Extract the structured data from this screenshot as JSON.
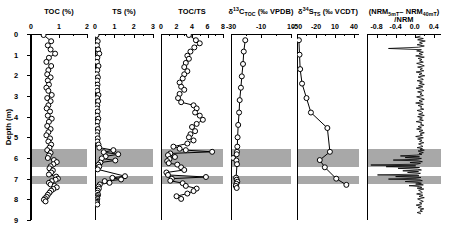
{
  "figure": {
    "y_axis": {
      "label": "Depth (m)",
      "ticks": [
        0,
        1,
        2,
        3,
        4,
        5,
        6,
        7,
        8,
        9
      ],
      "range": [
        0,
        9
      ]
    },
    "shaded_bands": [
      {
        "top": 5.58,
        "bottom": 6.42,
        "color": "#a8a8a8"
      },
      {
        "top": 6.86,
        "bottom": 7.28,
        "color": "#a8a8a8"
      }
    ]
  },
  "chart_data": [
    {
      "type": "line",
      "title": "TOC (%)",
      "xlabel": "TOC (%)",
      "ylabel": "Depth (m)",
      "xlim": [
        0,
        2
      ],
      "ylim": [
        0,
        9
      ],
      "xticks": [
        0,
        1,
        2
      ],
      "xticklabels": [
        "0",
        "1",
        "2"
      ],
      "yticks": [
        0,
        1,
        2,
        3,
        4,
        5,
        6,
        7,
        8,
        9
      ],
      "grid": false,
      "marker": "open-circle",
      "x": [
        0.45,
        0.72,
        0.6,
        0.7,
        0.86,
        0.64,
        0.55,
        0.72,
        0.62,
        0.58,
        0.7,
        0.6,
        0.64,
        0.55,
        0.62,
        0.74,
        0.58,
        0.7,
        0.62,
        0.56,
        0.68,
        0.6,
        0.74,
        0.64,
        0.58,
        0.7,
        0.62,
        0.55,
        0.68,
        0.62,
        0.72,
        0.66,
        0.58,
        0.7,
        0.64,
        0.6,
        0.82,
        0.92,
        0.8,
        0.7,
        0.66,
        0.78,
        0.72,
        0.64,
        0.9,
        0.96,
        0.88,
        0.74,
        0.64,
        0.7,
        0.84,
        0.92,
        0.8,
        0.72,
        0.66,
        0.6,
        0.56,
        0.5,
        0.46,
        0.52
      ],
      "y": [
        0.05,
        0.35,
        0.55,
        0.75,
        0.95,
        1.15,
        1.35,
        1.55,
        1.75,
        1.95,
        2.1,
        2.25,
        2.45,
        2.6,
        2.75,
        2.95,
        3.1,
        3.25,
        3.45,
        3.6,
        3.75,
        3.95,
        4.1,
        4.25,
        4.45,
        4.6,
        4.75,
        4.9,
        5.05,
        5.2,
        5.35,
        5.5,
        5.62,
        5.75,
        5.88,
        6.0,
        6.1,
        6.2,
        6.3,
        6.4,
        6.5,
        6.6,
        6.7,
        6.8,
        6.9,
        7.0,
        7.05,
        7.12,
        7.2,
        7.28,
        7.35,
        7.42,
        7.5,
        7.58,
        7.68,
        7.78,
        7.88,
        7.95,
        8.02,
        8.1
      ]
    },
    {
      "type": "line",
      "title": "TS (%)",
      "xlabel": "TS (%)",
      "ylabel": "Depth (m)",
      "xlim": [
        0,
        3
      ],
      "ylim": [
        0,
        9
      ],
      "xticks": [
        0,
        1,
        2,
        3
      ],
      "xticklabels": [
        "0",
        "1",
        "2",
        "3"
      ],
      "grid": false,
      "marker": "open-circle",
      "x": [
        0.08,
        0.14,
        0.1,
        0.16,
        0.22,
        0.12,
        0.1,
        0.18,
        0.12,
        0.09,
        0.15,
        0.11,
        0.13,
        0.1,
        0.12,
        0.18,
        0.11,
        0.16,
        0.12,
        0.1,
        0.14,
        0.11,
        0.17,
        0.13,
        0.1,
        0.15,
        0.12,
        0.1,
        0.14,
        0.12,
        0.18,
        0.22,
        0.95,
        0.45,
        1.2,
        0.55,
        0.35,
        1.05,
        0.28,
        0.18,
        0.22,
        0.14,
        1.55,
        0.9,
        1.35,
        0.5,
        0.75,
        0.25,
        0.18,
        0.2,
        0.14,
        0.12,
        0.16,
        0.12,
        0.1,
        0.12,
        0.08,
        0.1,
        0.09,
        0.12
      ],
      "y": [
        0.05,
        0.35,
        0.55,
        0.75,
        0.95,
        1.15,
        1.35,
        1.55,
        1.75,
        1.95,
        2.1,
        2.25,
        2.45,
        2.6,
        2.75,
        2.95,
        3.1,
        3.25,
        3.45,
        3.6,
        3.75,
        3.95,
        4.1,
        4.25,
        4.45,
        4.6,
        4.75,
        4.9,
        5.05,
        5.2,
        5.35,
        5.5,
        5.62,
        5.72,
        5.82,
        5.92,
        6.02,
        6.12,
        6.22,
        6.32,
        6.42,
        6.55,
        6.88,
        6.96,
        7.04,
        7.12,
        7.2,
        7.28,
        7.38,
        7.48,
        7.58,
        7.68,
        7.78,
        7.85,
        7.92,
        7.98,
        8.05,
        8.12,
        8.18,
        8.25
      ]
    },
    {
      "type": "line",
      "title": "TOC/TS",
      "xlabel": "TOC/TS",
      "ylabel": "Depth (m)",
      "xlim": [
        0,
        8
      ],
      "ylim": [
        0,
        9
      ],
      "xticks": [
        0,
        2,
        4,
        6,
        8
      ],
      "xticklabels": [
        "0",
        "2",
        "4",
        "6",
        "8"
      ],
      "grid": false,
      "marker": "open-circle",
      "x": [
        3.6,
        4.5,
        5.0,
        4.3,
        3.8,
        3.4,
        3.6,
        3.2,
        3.0,
        3.4,
        3.0,
        2.8,
        2.4,
        2.6,
        3.0,
        2.4,
        2.2,
        2.6,
        4.2,
        4.6,
        4.4,
        5.0,
        5.4,
        4.6,
        4.0,
        4.4,
        3.8,
        3.6,
        4.2,
        3.4,
        1.6,
        2.4,
        3.2,
        6.6,
        1.2,
        0.9,
        1.8,
        1.1,
        0.8,
        1.0,
        2.1,
        2.6,
        3.0,
        0.7,
        0.9,
        5.8,
        1.4,
        1.2,
        2.8,
        3.2,
        4.6,
        4.2,
        3.4,
        2.0,
        2.6
      ],
      "y": [
        0.05,
        0.3,
        0.45,
        0.65,
        0.85,
        1.05,
        1.2,
        1.4,
        1.6,
        1.8,
        1.95,
        2.15,
        2.35,
        2.55,
        2.7,
        2.9,
        3.1,
        3.3,
        3.45,
        3.6,
        3.8,
        3.95,
        4.15,
        4.35,
        4.5,
        4.7,
        4.85,
        5.0,
        5.15,
        5.3,
        5.45,
        5.55,
        5.62,
        5.7,
        5.78,
        5.86,
        5.95,
        6.05,
        6.15,
        6.25,
        6.32,
        6.45,
        6.58,
        6.7,
        6.82,
        6.92,
        7.0,
        7.1,
        7.22,
        7.35,
        7.48,
        7.6,
        7.72,
        7.85,
        7.98
      ]
    },
    {
      "type": "line",
      "title": "δ¹³C_TOC (‰ VPDB)",
      "xlabel": "δ¹³C_TOC (‰ VPDB)",
      "ylabel": "Depth (m)",
      "xlim": [
        -30,
        10
      ],
      "ylim": [
        0,
        9
      ],
      "xticks": [
        -30,
        -10,
        10
      ],
      "xticklabels": [
        "-30",
        "-10",
        "10"
      ],
      "grid": false,
      "marker": "open-circle",
      "x": [
        -20.5,
        -21.5,
        -22.0,
        -22.8,
        -23.4,
        -24.2,
        -24.6,
        -25.2,
        -25.6,
        -25.8,
        -26.0,
        -26.2,
        -28.6,
        -26.4,
        -26.0,
        -26.6,
        -26.2,
        -25.8,
        -26.4,
        -26.8,
        -26.2
      ],
      "y": [
        0.3,
        0.85,
        1.45,
        2.05,
        2.6,
        3.2,
        3.8,
        4.4,
        5.0,
        5.45,
        5.7,
        5.82,
        6.0,
        6.12,
        6.3,
        6.95,
        7.05,
        7.15,
        7.25,
        7.35,
        7.45
      ]
    },
    {
      "type": "line",
      "title": "δ³⁴S_TS (‰ VCDT)",
      "xlabel": "δ³⁴S_TS (‰ VCDT)",
      "ylabel": "Depth (m)",
      "xlim": [
        -50,
        48
      ],
      "ylim": [
        0,
        9
      ],
      "xticks": [
        -50,
        -20,
        10,
        40
      ],
      "xticklabels": [
        "-50",
        "-20",
        "10",
        "40"
      ],
      "grid": false,
      "marker": "open-circle",
      "x": [
        -47.0,
        -46.0,
        -45.0,
        -42.0,
        -35.0,
        -28.0,
        -2.0,
        2.0,
        -14.0,
        -6.0,
        12.0,
        28.0
      ],
      "y": [
        0.3,
        1.0,
        1.7,
        2.4,
        3.1,
        3.8,
        4.55,
        5.7,
        6.1,
        6.45,
        7.0,
        7.3
      ]
    },
    {
      "type": "line",
      "title": "(NRM₅ₘₜ - NRM₄₀ₘₜ)/NRM",
      "xlabel": "(NRM5mT - NRM40mT)/NRM",
      "ylabel": "Depth (m)",
      "xlim": [
        -1.0,
        0.55
      ],
      "ylim": [
        0,
        9
      ],
      "xticks": [
        -0.8,
        -0.4,
        0.0,
        0.4
      ],
      "xticklabels": [
        "-0.8",
        "-0.4",
        "0.0",
        "0.4"
      ],
      "grid": false,
      "marker": "none",
      "note": "high-resolution continuous wiggle trace centered near 0.0 with large negative excursions coincident with shaded bands",
      "x": [
        0.12,
        0.02,
        0.18,
        0.06,
        0.22,
        0.1,
        0.16,
        0.05,
        0.2,
        0.08,
        -0.55,
        0.14,
        0.04,
        0.18,
        0.09,
        0.16,
        0.02,
        0.2,
        0.07,
        0.15,
        0.1,
        0.18,
        0.04,
        0.13,
        0.2,
        0.06,
        0.16,
        0.11,
        0.19,
        0.03,
        0.15,
        0.09,
        0.21,
        0.07,
        0.14,
        0.18,
        0.05,
        0.16,
        0.1,
        0.2,
        0.08,
        0.17,
        0.03,
        0.14,
        0.19,
        0.06,
        0.15,
        0.11,
        0.18,
        0.04,
        0.13,
        0.2,
        0.09,
        0.16,
        0.02,
        0.18,
        0.07,
        0.15,
        0.12,
        0.19,
        0.05,
        0.14,
        0.17,
        0.08,
        0.2,
        0.06,
        0.16,
        0.1,
        0.18,
        0.03,
        0.15,
        0.12,
        0.19,
        0.07,
        0.14,
        0.04,
        0.17,
        0.09,
        0.2,
        0.11,
        0.16,
        0.02,
        0.18,
        0.06,
        0.15,
        0.1,
        0.19,
        0.08,
        0.14,
        0.17,
        0.05,
        0.16,
        0.11,
        0.2,
        0.07,
        0.13,
        0.18,
        0.09,
        0.15,
        0.04,
        -0.3,
        0.1,
        -0.2,
        0.14,
        0.06,
        -0.45,
        0.08,
        0.16,
        -0.1,
        0.12,
        0.04,
        -0.92,
        0.02,
        -0.6,
        0.1,
        -0.35,
        0.06,
        0.14,
        -0.25,
        0.08,
        -0.15,
        0.12,
        0.05,
        -0.78,
        0.09,
        -0.4,
        0.13,
        0.03,
        -0.55,
        0.11,
        0.16,
        -0.2,
        0.07,
        0.14,
        0.02,
        0.18,
        -0.12,
        0.1,
        0.15,
        0.05,
        0.19,
        0.08,
        0.13,
        0.16,
        0.04,
        0.17,
        0.09,
        0.2,
        0.06,
        0.12,
        0.18,
        0.1,
        0.15,
        0.03,
        0.14,
        0.07,
        0.19,
        0.11,
        0.16,
        0.05,
        0.13
      ],
      "y": [
        0.1,
        0.16,
        0.22,
        0.28,
        0.34,
        0.4,
        0.46,
        0.52,
        0.58,
        0.64,
        0.7,
        0.76,
        0.82,
        0.88,
        0.94,
        1.0,
        1.06,
        1.12,
        1.18,
        1.24,
        1.3,
        1.36,
        1.42,
        1.48,
        1.54,
        1.6,
        1.66,
        1.72,
        1.78,
        1.84,
        1.9,
        1.96,
        2.02,
        2.08,
        2.14,
        2.2,
        2.26,
        2.32,
        2.38,
        2.44,
        2.5,
        2.56,
        2.62,
        2.68,
        2.74,
        2.8,
        2.86,
        2.92,
        2.98,
        3.04,
        3.1,
        3.16,
        3.22,
        3.28,
        3.34,
        3.4,
        3.46,
        3.52,
        3.58,
        3.64,
        3.7,
        3.76,
        3.82,
        3.88,
        3.94,
        4.0,
        4.06,
        4.12,
        4.18,
        4.24,
        4.3,
        4.36,
        4.42,
        4.48,
        4.54,
        4.6,
        4.66,
        4.72,
        4.78,
        4.84,
        4.9,
        4.96,
        5.02,
        5.08,
        5.14,
        5.2,
        5.26,
        5.32,
        5.38,
        5.44,
        5.5,
        5.54,
        5.58,
        5.62,
        5.66,
        5.7,
        5.74,
        5.78,
        5.82,
        5.86,
        5.9,
        5.94,
        5.98,
        6.02,
        6.06,
        6.1,
        6.14,
        6.18,
        6.22,
        6.26,
        6.3,
        6.34,
        6.38,
        6.42,
        6.46,
        6.5,
        6.54,
        6.58,
        6.62,
        6.66,
        6.7,
        6.74,
        6.78,
        6.82,
        6.86,
        6.9,
        6.94,
        6.98,
        7.02,
        7.06,
        7.1,
        7.14,
        7.18,
        7.22,
        7.26,
        7.3,
        7.34,
        7.38,
        7.42,
        7.46,
        7.5,
        7.56,
        7.62,
        7.68,
        7.74,
        7.8,
        7.86,
        7.92,
        7.98,
        8.04,
        8.1,
        8.16,
        8.22,
        8.28,
        8.34,
        8.4,
        8.46,
        8.52,
        8.58,
        8.64,
        8.7
      ]
    }
  ]
}
